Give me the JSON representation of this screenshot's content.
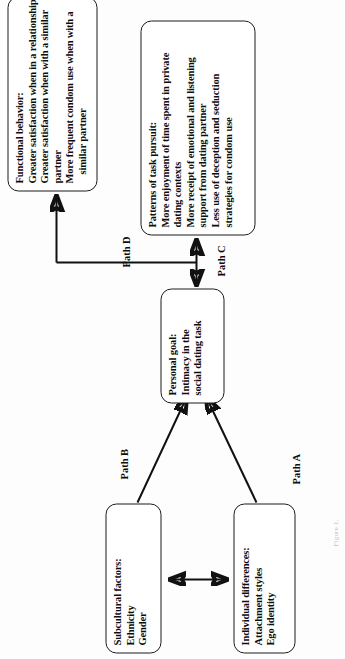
{
  "figure": {
    "type": "path-model-diagram",
    "orientation": "rotated-90-counterclockwise",
    "caption": "Figure 1.",
    "nodes": [
      {
        "id": "individual-differences",
        "title": "Individual differences:",
        "lines": [
          "Attachment styles",
          "Ego identity"
        ]
      },
      {
        "id": "subcultural-factors",
        "title": "Subcultural factors:",
        "lines": [
          "Ethnicity",
          "Gender"
        ]
      },
      {
        "id": "personal-goal",
        "title": "Personal goal:",
        "lines": [
          "Intimacy in the",
          "social dating task"
        ]
      },
      {
        "id": "patterns-of-task-pursuit",
        "title": "Patterns of task pursuit:",
        "lines": [
          "More enjoyment of time spent in private",
          "dating contexts",
          "More receipt of emotional and listening",
          "support from dating partner",
          "Less use of deception and seduction",
          "strategies for condom use"
        ]
      },
      {
        "id": "functional-behavior",
        "title": "Functional behavior:",
        "lines": [
          "Greater satisfaction when in a relationship",
          "Greater satisfaction when with a similar",
          "partner",
          "More frequent condom use when with a",
          "similar partner"
        ]
      }
    ],
    "edges": [
      {
        "id": "path-a",
        "label": "Path A",
        "from": "individual-differences",
        "to": "personal-goal",
        "arrow": "single"
      },
      {
        "id": "path-b",
        "label": "Path B",
        "from": "subcultural-factors",
        "to": "personal-goal",
        "arrow": "single"
      },
      {
        "id": "path-c",
        "label": "Path C",
        "from": "personal-goal",
        "to": "patterns-of-task-pursuit",
        "arrow": "double"
      },
      {
        "id": "path-d",
        "label": "Path D",
        "from": "patterns-of-task-pursuit",
        "to": "functional-behavior",
        "arrow": "single"
      },
      {
        "id": "correlation-link",
        "label": "",
        "from": "individual-differences",
        "to": "subcultural-factors",
        "arrow": "double"
      }
    ],
    "colors": {
      "stroke": "#111111",
      "text": "#0d0d0d",
      "box_fill": "#ffffff",
      "page_bg": "#fdfdfd",
      "caption_gray": "#c2c2c2"
    }
  }
}
